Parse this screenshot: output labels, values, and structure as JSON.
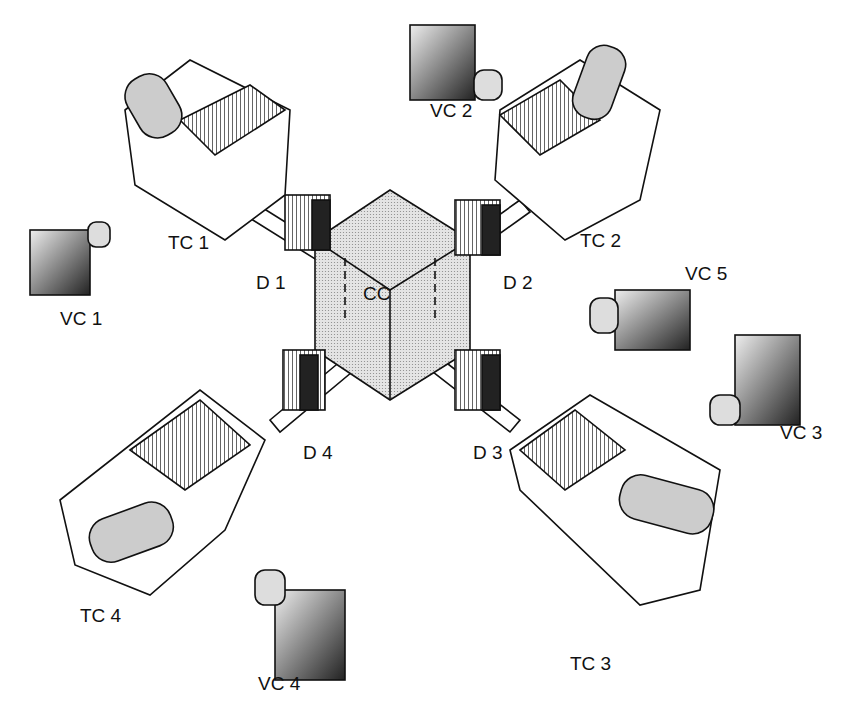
{
  "diagram": {
    "type": "isometric apparatus schematic",
    "central": {
      "label": "CC"
    },
    "doors": [
      {
        "label": "D 1"
      },
      {
        "label": "D 2"
      },
      {
        "label": "D 3"
      },
      {
        "label": "D 4"
      }
    ],
    "target_chambers": [
      {
        "label": "TC 1"
      },
      {
        "label": "TC 2"
      },
      {
        "label": "TC 3"
      },
      {
        "label": "TC 4"
      }
    ],
    "video_cameras": [
      {
        "label": "VC 1"
      },
      {
        "label": "VC 2"
      },
      {
        "label": "VC 3"
      },
      {
        "label": "VC 4"
      },
      {
        "label": "VC 5"
      }
    ],
    "colors": {
      "ink": "#111111",
      "light_fill": "#d8d8d8",
      "mid_fill": "#a9a9a9",
      "dark_fill": "#2a2a2a"
    }
  }
}
